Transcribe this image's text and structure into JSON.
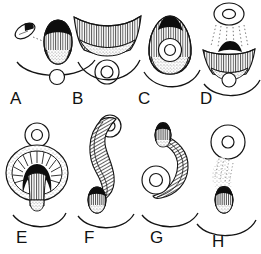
{
  "figure": {
    "title": "",
    "background_color": "#ffffff",
    "ink_color": "#111111",
    "panel_count": 8,
    "panels": [
      {
        "label": "A",
        "label_x": 10,
        "label_y": 104,
        "description": "Small tilted dark-tipped oval at upper left connected by a faint dotted line to a larger ovoid with black apical cap and vertically hatched body; curved arc beneath; small open circle below the arc.",
        "elements": [
          "small-dark-tipped-oval",
          "dotted-connector",
          "large-hatched-ovoid-black-cap",
          "curved-arc",
          "small-open-circle"
        ]
      },
      {
        "label": "B",
        "label_x": 72,
        "label_y": 104,
        "description": "Wide downward-curving fan band with dense vertical hatching over a stippled lower band; concentric donut circle beneath; curved arc below.",
        "elements": [
          "hatched-fan-band",
          "stippled-band",
          "donut-circle",
          "curved-arc"
        ]
      },
      {
        "label": "C",
        "label_x": 138,
        "label_y": 104,
        "description": "Teardrop ovoid with black apical cap and hatched body enclosing a donut circle in its lower half; curved arc below.",
        "elements": [
          "teardrop-ovoid-black-cap",
          "hatched-body",
          "donut-circle-inside",
          "curved-arc"
        ]
      },
      {
        "label": "D",
        "label_x": 200,
        "label_y": 104,
        "description": "Donut circle at top with a stippled dotted stream flowing downward onto a hatched fan band topped by a black cap; small circle beneath; curved arc below.",
        "elements": [
          "donut-circle-top",
          "dotted-stream",
          "hatched-fan-band-black-cap",
          "small-circle",
          "curved-arc"
        ]
      },
      {
        "label": "E",
        "label_x": 16,
        "label_y": 243,
        "description": "Donut circle at top above a large round radiating stippled disc containing a dark arch/crescent over a hatched cone; curved arc below.",
        "elements": [
          "donut-circle-top",
          "radiating-disc",
          "dark-arch-crescent",
          "hatched-cone",
          "curved-arc"
        ]
      },
      {
        "label": "F",
        "label_x": 84,
        "label_y": 243,
        "description": "Long S-curved hatched ribbon descending from a donut circle at upper right to a small dark-capped ovoid at lower left; curved arc below.",
        "elements": [
          "donut-circle-top",
          "s-curved-hatched-ribbon",
          "dark-capped-ovoid",
          "curved-arc"
        ]
      },
      {
        "label": "G",
        "label_x": 150,
        "label_y": 243,
        "description": "Small dark-capped ovoid at top with a hooked hatched ribbon curving down and around a donut circle at lower left; curved arc below.",
        "elements": [
          "dark-capped-ovoid-top",
          "hooked-hatched-ribbon",
          "donut-circle",
          "curved-arc"
        ]
      },
      {
        "label": "H",
        "label_x": 212,
        "label_y": 247,
        "description": "Donut circle at top with a stippled dotted trail streaming down and left to a small dark-capped ovoid; curved arc below.",
        "elements": [
          "donut-circle-top",
          "stippled-trail",
          "dark-capped-ovoid",
          "curved-arc"
        ]
      }
    ]
  }
}
